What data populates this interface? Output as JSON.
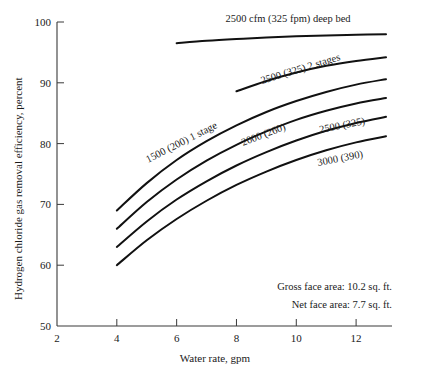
{
  "chart_data": {
    "type": "line",
    "title": "",
    "xlabel": "Water rate, gpm",
    "ylabel": "Hydrogen chloride gas removal efficiency, percent",
    "xlim": [
      2,
      13.2
    ],
    "ylim": [
      50,
      100
    ],
    "xticks": [
      2,
      4,
      6,
      8,
      10,
      12
    ],
    "yticks": [
      50,
      60,
      70,
      80,
      90,
      100
    ],
    "xtick_labels": [
      "2",
      "4",
      "6",
      "8",
      "10",
      "12"
    ],
    "ytick_labels": [
      "50",
      "60",
      "70",
      "80",
      "90",
      "100"
    ],
    "grid": false,
    "legend": "inline-curve-labels",
    "series": [
      {
        "name": "2500 cfm (325 fpm) deep bed",
        "label": "2500 cfm (325 fpm) deep bed",
        "x": [
          6.0,
          7.0,
          8.0,
          9.0,
          10.0,
          11.0,
          12.0,
          13.0
        ],
        "y": [
          96.5,
          96.9,
          97.2,
          97.45,
          97.65,
          97.8,
          97.9,
          98.0
        ]
      },
      {
        "name": "2500 (325) 2 stages",
        "label": "2500 (325) 2 stages",
        "x": [
          8.0,
          9.0,
          10.0,
          11.0,
          12.0,
          13.0
        ],
        "y": [
          88.6,
          90.3,
          91.7,
          92.8,
          93.6,
          94.2
        ]
      },
      {
        "name": "1500 (200) 1 stage",
        "label": "1500 (200) 1 stage",
        "x": [
          4.0,
          5.0,
          6.0,
          7.0,
          8.0,
          9.0,
          10.0,
          11.0,
          12.0,
          13.0
        ],
        "y": [
          69.0,
          73.5,
          77.3,
          80.4,
          83.0,
          85.2,
          87.0,
          88.5,
          89.7,
          90.6
        ]
      },
      {
        "name": "2000 (260)",
        "label": "2000 (260)",
        "x": [
          4.0,
          5.0,
          6.0,
          7.0,
          8.0,
          9.0,
          10.0,
          11.0,
          12.0,
          13.0
        ],
        "y": [
          66.0,
          70.4,
          74.1,
          77.2,
          79.8,
          82.0,
          83.9,
          85.4,
          86.6,
          87.5
        ]
      },
      {
        "name": "2500 (325)",
        "label": "2500 (325)",
        "x": [
          4.0,
          5.0,
          6.0,
          7.0,
          8.0,
          9.0,
          10.0,
          11.0,
          12.0,
          13.0
        ],
        "y": [
          63.0,
          67.2,
          70.8,
          73.8,
          76.4,
          78.6,
          80.5,
          82.1,
          83.4,
          84.4
        ]
      },
      {
        "name": "3000 (390)",
        "label": "3000 (390)",
        "x": [
          4.0,
          5.0,
          6.0,
          7.0,
          8.0,
          9.0,
          10.0,
          11.0,
          12.0,
          13.0
        ],
        "y": [
          60.0,
          64.1,
          67.6,
          70.6,
          73.2,
          75.4,
          77.3,
          78.9,
          80.2,
          81.2
        ]
      }
    ],
    "annotations": [
      "Gross face area: 10.2 sq. ft.",
      "Net face area: 7.7 sq. ft."
    ]
  },
  "notes": {
    "gross_face_area": "Gross face area: 10.2 sq. ft.",
    "net_face_area": "Net face area: 7.7 sq. ft."
  }
}
